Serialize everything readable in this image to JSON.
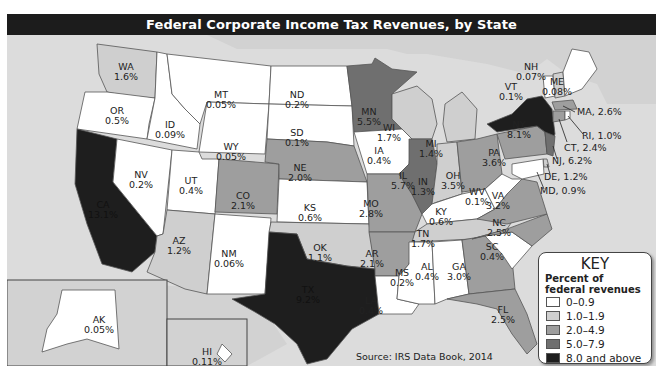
{
  "title": "Federal Corporate Income Tax Revenues, by State",
  "source": "Source: IRS Data Book, 2014",
  "colors": {
    "ocean": "#dcdcdc",
    "land_other": "#d2d2d2",
    "bin0": "#ffffff",
    "bin1": "#cfcfcf",
    "bin2": "#9e9e9e",
    "bin3": "#6f6f6f",
    "bin4": "#1e1e1e"
  },
  "key": {
    "title": "KEY",
    "subtitle_line1": "Percent of",
    "subtitle_line2": "federal revenues",
    "bins": [
      {
        "label": "0–0.9",
        "color": "#ffffff"
      },
      {
        "label": "1.0–1.9",
        "color": "#cfcfcf"
      },
      {
        "label": "2.0–4.9",
        "color": "#9e9e9e"
      },
      {
        "label": "5.0–7.9",
        "color": "#6f6f6f"
      },
      {
        "label": "8.0 and above",
        "color": "#1e1e1e"
      }
    ]
  },
  "states": {
    "WA": {
      "abbr": "WA",
      "value": "1.6%"
    },
    "OR": {
      "abbr": "OR",
      "value": "0.5%"
    },
    "CA": {
      "abbr": "CA",
      "value": "13.1%"
    },
    "NV": {
      "abbr": "NV",
      "value": "0.2%"
    },
    "ID": {
      "abbr": "ID",
      "value": "0.09%"
    },
    "MT": {
      "abbr": "MT",
      "value": "0.05%"
    },
    "WY": {
      "abbr": "WY",
      "value": "0.05%"
    },
    "UT": {
      "abbr": "UT",
      "value": "0.4%"
    },
    "AZ": {
      "abbr": "AZ",
      "value": "1.2%"
    },
    "CO": {
      "abbr": "CO",
      "value": "2.1%"
    },
    "NM": {
      "abbr": "NM",
      "value": "0.06%"
    },
    "ND": {
      "abbr": "ND",
      "value": "0.2%"
    },
    "SD": {
      "abbr": "SD",
      "value": "0.1%"
    },
    "NE": {
      "abbr": "NE",
      "value": "2.0%"
    },
    "KS": {
      "abbr": "KS",
      "value": "0.6%"
    },
    "OK": {
      "abbr": "OK",
      "value": "1.1%"
    },
    "TX": {
      "abbr": "TX",
      "value": "9.2%"
    },
    "MN": {
      "abbr": "MN",
      "value": "5.5%"
    },
    "IA": {
      "abbr": "IA",
      "value": "0.4%"
    },
    "MO": {
      "abbr": "MO",
      "value": "2.8%"
    },
    "AR": {
      "abbr": "AR",
      "value": "2.1%"
    },
    "LA": {
      "abbr": "LA",
      "value": "0.4%"
    },
    "WI": {
      "abbr": "WI",
      "value": "1.7%"
    },
    "IL": {
      "abbr": "IL",
      "value": "5.7%"
    },
    "MI": {
      "abbr": "MI",
      "value": "1.4%"
    },
    "IN": {
      "abbr": "IN",
      "value": "1.3%"
    },
    "OH": {
      "abbr": "OH",
      "value": "3.5%"
    },
    "KY": {
      "abbr": "KY",
      "value": "0.6%"
    },
    "TN": {
      "abbr": "TN",
      "value": "1.7%"
    },
    "MS": {
      "abbr": "MS",
      "value": "0.2%"
    },
    "AL": {
      "abbr": "AL",
      "value": "0.4%"
    },
    "GA": {
      "abbr": "GA",
      "value": "3.0%"
    },
    "FL": {
      "abbr": "FL",
      "value": "2.5%"
    },
    "SC": {
      "abbr": "SC",
      "value": "0.4%"
    },
    "NC": {
      "abbr": "NC",
      "value": "2.5%"
    },
    "VA": {
      "abbr": "VA",
      "value": "3.2%"
    },
    "WV": {
      "abbr": "WV",
      "value": "0.1%"
    },
    "PA": {
      "abbr": "PA",
      "value": "3.6%"
    },
    "NY": {
      "abbr": "NY",
      "value": "8.1%"
    },
    "VT": {
      "abbr": "VT",
      "value": "0.1%"
    },
    "NH": {
      "abbr": "NH",
      "value": "0.07%"
    },
    "ME": {
      "abbr": "ME",
      "value": "0.08%"
    },
    "AK": {
      "abbr": "AK",
      "value": "0.05%"
    },
    "HI": {
      "abbr": "HI",
      "value": "0.11%"
    }
  },
  "callouts": {
    "MA": "MA, 2.6%",
    "RI": "RI, 1.0%",
    "CT": "CT, 2.4%",
    "NJ": "NJ, 6.2%",
    "DE": "DE, 1.2%",
    "MD": "MD, 0.9%"
  }
}
